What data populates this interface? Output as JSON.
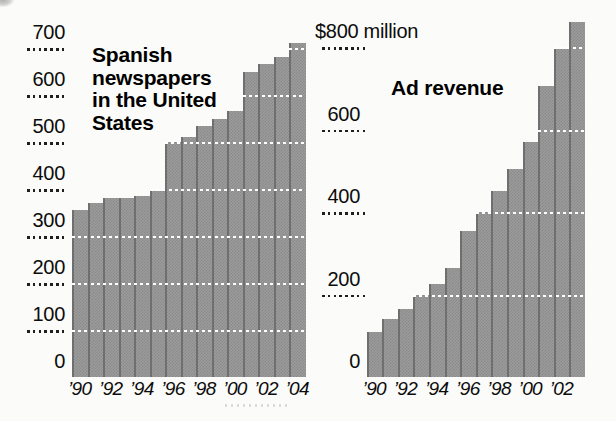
{
  "figure_type": "scanned print graphic, two halftone bar charts",
  "colors": {
    "background": "#fbfbf9",
    "bar_fill": "#9b9b9b",
    "bar_halftone_dark": "#8a8a8a",
    "bar_separator": "#6f6f6f",
    "grid_dots_black": "#1f1f1f",
    "grid_dots_white": "#ffffff",
    "text": "#0c0c0c"
  },
  "chart_data": [
    {
      "type": "bar",
      "title": "Spanish newspapers in the United States",
      "title_lines": [
        "Spanish",
        "newspapers",
        "in the United",
        "States"
      ],
      "categories": [
        "1990",
        "1991",
        "1992",
        "1993",
        "1994",
        "1995",
        "1996",
        "1997",
        "1998",
        "1999",
        "2000",
        "2001",
        "2002",
        "2003",
        "2004"
      ],
      "values": [
        355,
        370,
        380,
        380,
        385,
        395,
        500,
        510,
        535,
        550,
        565,
        650,
        665,
        680,
        710
      ],
      "x_tick_labels": [
        "’90",
        "’92",
        "’94",
        "’96",
        "’98",
        "’00",
        "’02",
        "’04"
      ],
      "yticks": [
        0,
        100,
        200,
        300,
        400,
        500,
        600,
        700
      ],
      "ytick_labels": [
        "0",
        "100",
        "200",
        "300",
        "400",
        "500",
        "600",
        "700"
      ],
      "ylim": [
        0,
        720
      ],
      "xlabel": "",
      "ylabel": "",
      "grid": "dotted horizontal lines, black beside axis labels, white where crossing bars",
      "legend": null
    },
    {
      "type": "bar",
      "title": "Ad revenue",
      "title_lines": [
        "Ad revenue"
      ],
      "categories": [
        "1990",
        "1991",
        "1992",
        "1993",
        "1994",
        "1995",
        "1996",
        "1997",
        "1998",
        "1999",
        "2000",
        "2001",
        "2002",
        "2003"
      ],
      "values": [
        110,
        140,
        165,
        200,
        225,
        265,
        355,
        400,
        450,
        505,
        570,
        705,
        795,
        860
      ],
      "x_tick_labels": [
        "’90",
        "’92",
        "’94",
        "’96",
        "’98",
        "’00",
        "’02"
      ],
      "yticks": [
        0,
        200,
        400,
        600,
        800
      ],
      "ytick_labels": [
        "0",
        "200",
        "400",
        "600",
        "$800 million"
      ],
      "ylim": [
        0,
        880
      ],
      "xlabel": "",
      "ylabel": "",
      "grid": "dotted horizontal lines, black beside axis labels, white where crossing bars",
      "legend": null
    }
  ]
}
